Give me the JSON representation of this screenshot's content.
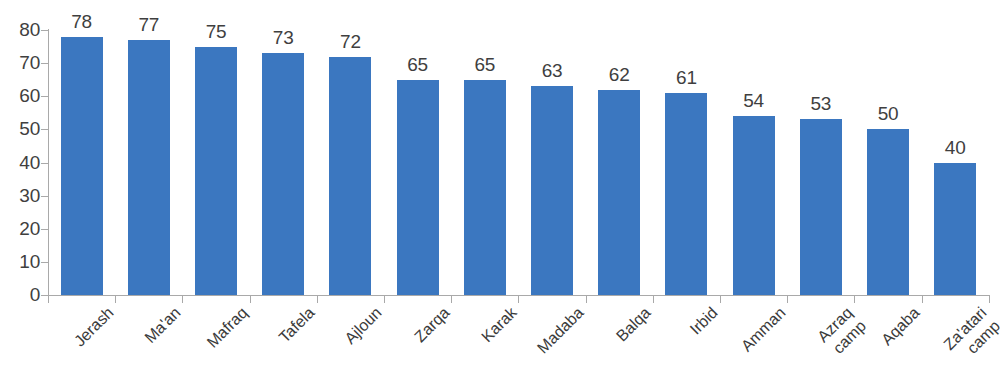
{
  "chart_data": {
    "type": "bar",
    "title": "",
    "subtitle": "",
    "xlabel": "",
    "ylabel": "",
    "ylim": [
      0,
      80
    ],
    "y_ticks": [
      0,
      10,
      20,
      30,
      40,
      50,
      60,
      70,
      80
    ],
    "grid": false,
    "legend": "none",
    "series_color": "#3b77c0",
    "label_color": "#3f3f3f",
    "axis_color": "#a9a9a9",
    "background": "#ffffff",
    "categories": [
      "Jerash",
      "Ma'an",
      "Mafraq",
      "Tafela",
      "Ajloun",
      "Zarqa",
      "Karak",
      "Madaba",
      "Balqa",
      "Irbid",
      "Amman",
      "Azraq camp",
      "Aqaba",
      "Za'atari camp"
    ],
    "category_lines": [
      [
        "Jerash"
      ],
      [
        "Ma'an"
      ],
      [
        "Mafraq"
      ],
      [
        "Tafela"
      ],
      [
        "Ajloun"
      ],
      [
        "Zarqa"
      ],
      [
        "Karak"
      ],
      [
        "Madaba"
      ],
      [
        "Balqa"
      ],
      [
        "Irbid"
      ],
      [
        "Amman"
      ],
      [
        "Azraq",
        "camp"
      ],
      [
        "Aqaba"
      ],
      [
        "Za'atari",
        "camp"
      ]
    ],
    "values": [
      78,
      77,
      75,
      73,
      72,
      65,
      65,
      63,
      62,
      61,
      54,
      53,
      50,
      40
    ],
    "value_labels": [
      "78",
      "77",
      "75",
      "73",
      "72",
      "65",
      "65",
      "63",
      "62",
      "61",
      "54",
      "53",
      "50",
      "40"
    ],
    "y_tick_labels": [
      "0",
      "10",
      "20",
      "30",
      "40",
      "50",
      "60",
      "70",
      "80"
    ]
  }
}
